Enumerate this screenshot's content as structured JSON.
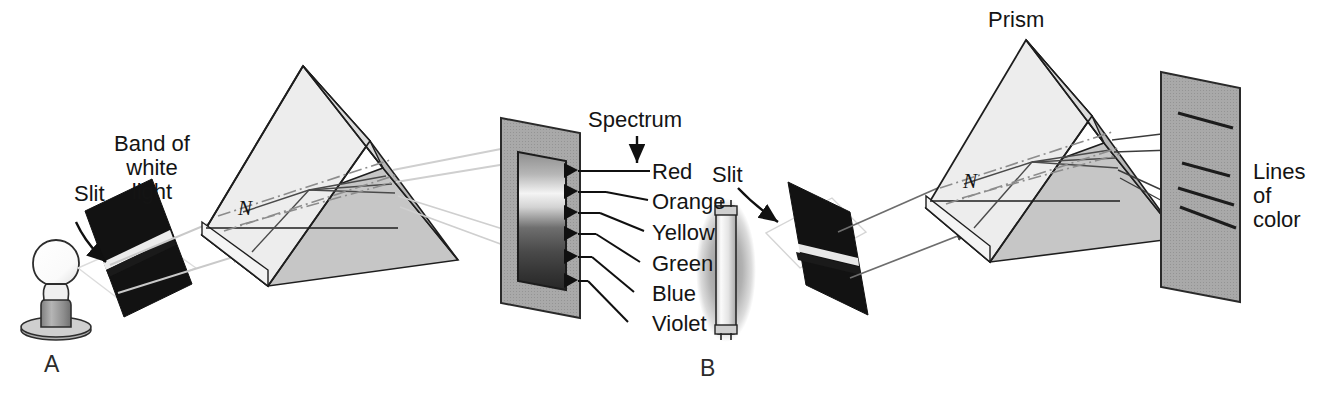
{
  "figure": {
    "background_color": "#ffffff",
    "width": 1329,
    "height": 406
  },
  "palette": {
    "ink": "#141414",
    "prism_light_face": "#ededed",
    "prism_mid_face": "#d2d2d2",
    "prism_dark_face": "#b4b4b4",
    "prism_base_face": "#c6c6c6",
    "screen_fill": "#a8a8a8",
    "screen_edge": "#2a2a2a",
    "slit_fill": "#121212",
    "ray_light": "#c9c9c9",
    "ray_dark": "#6d6d6d",
    "normal_line": "#8c8c8c",
    "bulb_glass": "#fdfdfd",
    "bulb_base": "#9a9a9a",
    "tube_glow": "#b9b9b9",
    "tube_glass": "#f2f2f2"
  },
  "panel_a": {
    "letter": "A",
    "source_type": "incandescent-bulb",
    "labels": {
      "slit": "Slit",
      "band_of_white_light": "Band of\nwhite\nlight",
      "normal": "N",
      "spectrum": "Spectrum"
    },
    "spectrum_colors": [
      "Red",
      "Orange",
      "Yellow",
      "Green",
      "Blue",
      "Violet"
    ],
    "spectrum_description": "continuous band",
    "arrow_count": 6
  },
  "panel_b": {
    "letter": "B",
    "source_type": "fluorescent-tube",
    "labels": {
      "slit": "Slit",
      "prism": "Prism",
      "normal": "N",
      "lines_of_color": "Lines\nof\ncolor"
    },
    "line_count": 4,
    "spectrum_description": "discrete lines"
  }
}
